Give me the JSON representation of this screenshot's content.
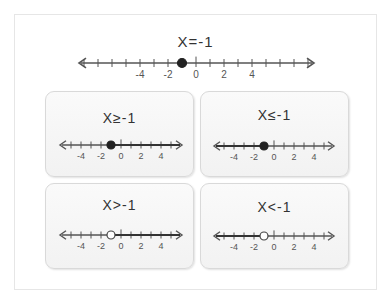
{
  "main": {
    "title": "X=-1",
    "axis": {
      "min": -8,
      "max": 8,
      "labels": [
        "-4",
        "-2",
        "0",
        "2",
        "4"
      ],
      "label_values": [
        -4,
        -2,
        0,
        2,
        4
      ]
    },
    "point": {
      "value": -1,
      "style": "closed"
    }
  },
  "cards": [
    {
      "title": "X≥-1",
      "point": {
        "value": -1,
        "style": "closed"
      },
      "ray": "right"
    },
    {
      "title": "X≤-1",
      "point": {
        "value": -1,
        "style": "closed"
      },
      "ray": "left"
    },
    {
      "title": "X>-1",
      "point": {
        "value": -1,
        "style": "open"
      },
      "ray": "right"
    },
    {
      "title": "X<-1",
      "point": {
        "value": -1,
        "style": "open"
      },
      "ray": "left"
    }
  ],
  "card_axis": {
    "min": -5,
    "max": 5,
    "labels": [
      "-4",
      "-2",
      "0",
      "2",
      "4"
    ],
    "label_values": [
      -4,
      -2,
      0,
      2,
      4
    ]
  },
  "colors": {
    "line": "#555555",
    "text": "#333333",
    "point_fill": "#222222",
    "open_fill": "#ffffff"
  }
}
